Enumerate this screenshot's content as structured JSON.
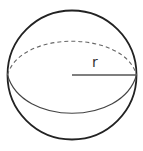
{
  "diagram": {
    "radius_label": "r",
    "colors": {
      "outline": "#222222",
      "equator": "#444444",
      "radius_line": "#555555",
      "label": "#333333",
      "background": "#ffffff"
    },
    "elements": [
      {
        "type": "sphere-outline",
        "shape": "circle"
      },
      {
        "type": "equator-back",
        "style": "dashed"
      },
      {
        "type": "equator-front",
        "style": "solid"
      },
      {
        "type": "radius-line",
        "from": "center",
        "to": "right-edge"
      }
    ]
  }
}
